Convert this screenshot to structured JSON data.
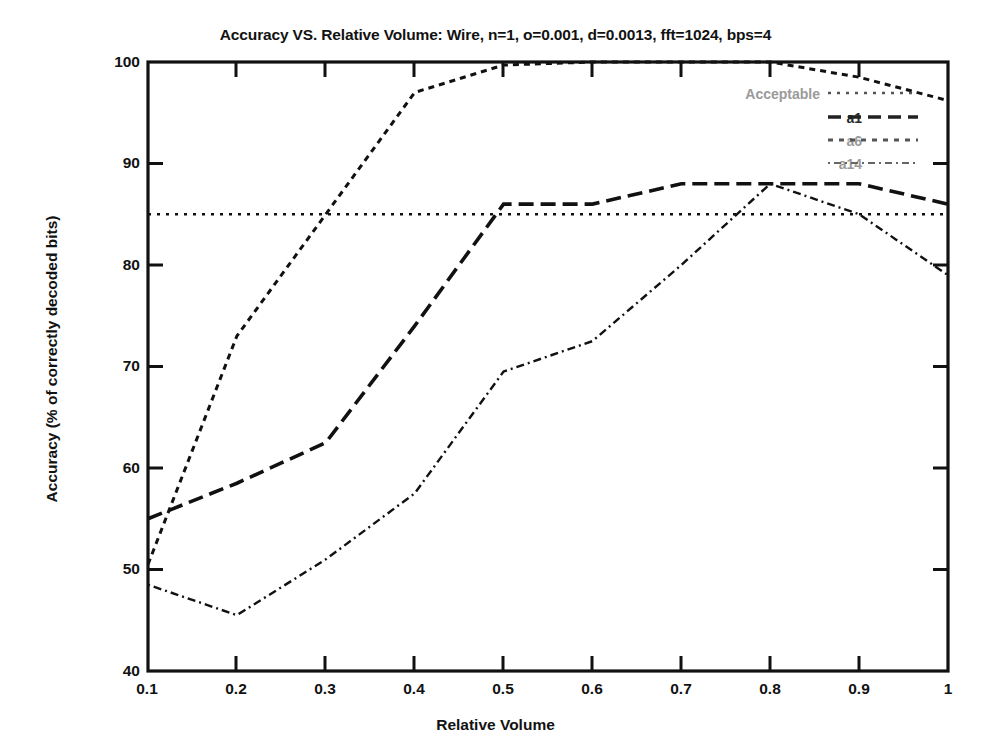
{
  "chart_data": {
    "type": "line",
    "title": "Accuracy VS. Relative Volume: Wire, n=1, o=0.001, d=0.0013, fft=1024, bps=4",
    "xlabel": "Relative Volume",
    "ylabel": "Accuracy (% of correctly decoded bits)",
    "xlim": [
      0.1,
      1.0
    ],
    "ylim": [
      40,
      100
    ],
    "xticks": [
      "0.1",
      "0.2",
      "0.3",
      "0.4",
      "0.5",
      "0.6",
      "0.7",
      "0.8",
      "0.9",
      "1"
    ],
    "xtick_values": [
      0.1,
      0.2,
      0.3,
      0.4,
      0.5,
      0.6,
      0.7,
      0.8,
      0.9,
      1.0
    ],
    "yticks": [
      "40",
      "50",
      "60",
      "70",
      "80",
      "90",
      "100"
    ],
    "ytick_values": [
      40,
      50,
      60,
      70,
      80,
      90,
      100
    ],
    "grid": false,
    "legend_position": "top-right",
    "x": [
      0.1,
      0.2,
      0.3,
      0.4,
      0.5,
      0.6,
      0.7,
      0.8,
      0.9,
      1.0
    ],
    "series": [
      {
        "name": "Acceptable",
        "style": "dotted",
        "constant": 85,
        "values": [
          85,
          85,
          85,
          85,
          85,
          85,
          85,
          85,
          85,
          85
        ]
      },
      {
        "name": "a1",
        "style": "dashed",
        "values": [
          55.0,
          58.5,
          62.5,
          74.0,
          86.0,
          86.0,
          88.0,
          88.0,
          88.0,
          86.0
        ]
      },
      {
        "name": "a6",
        "style": "dotted-coarse",
        "values": [
          50.5,
          73.0,
          85.0,
          97.0,
          99.7,
          100.0,
          100.0,
          100.0,
          98.5,
          96.2
        ]
      },
      {
        "name": "a14",
        "style": "dotted-fine",
        "values": [
          48.5,
          45.5,
          51.0,
          57.5,
          69.5,
          72.5,
          80.0,
          88.0,
          85.0,
          79.0
        ]
      }
    ]
  },
  "legend": {
    "entries": [
      {
        "label": "Acceptable"
      },
      {
        "label": "a1"
      },
      {
        "label": "a6"
      },
      {
        "label": "a14"
      }
    ]
  }
}
